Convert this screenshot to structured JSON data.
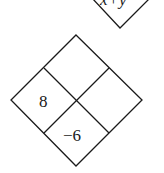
{
  "top_diamond": {
    "label": "x+y"
  },
  "main_diamond": {
    "cells": {
      "top": "",
      "right": "",
      "left": "8",
      "bottom": "−6"
    }
  },
  "colors": {
    "stroke": "#1a1a1a",
    "background": "#ffffff"
  }
}
